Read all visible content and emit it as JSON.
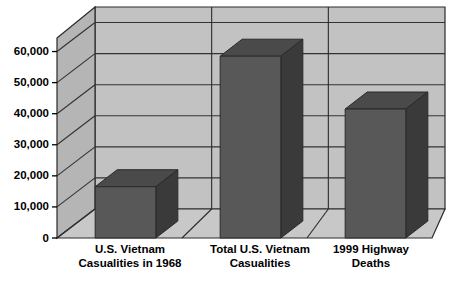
{
  "chart_data": {
    "type": "bar",
    "title": "",
    "subtitle": "",
    "xlabel": "",
    "ylabel": "",
    "categories": [
      "U.S. Vietnam\nCasualities in 1968",
      "Total U.S. Vietnam\nCasualities",
      "1999 Highway\nDeaths"
    ],
    "category_lines": [
      [
        "U.S. Vietnam",
        "Casualities in 1968"
      ],
      [
        "Total U.S. Vietnam",
        "Casualities"
      ],
      [
        "1999 Highway",
        "Deaths"
      ]
    ],
    "values": [
      16500,
      58500,
      41500
    ],
    "ylim": [
      0,
      65000
    ],
    "yticks": [
      0,
      10000,
      20000,
      30000,
      40000,
      50000,
      60000
    ],
    "ytick_labels": [
      "0",
      "10,000",
      "20,000",
      "30,000",
      "40,000",
      "50,000",
      "60,000"
    ],
    "grid": true,
    "legend": false,
    "legend_position": "none",
    "style": "3d-column",
    "colors": {
      "bar_front": "#585858",
      "bar_side": "#3a3a3a",
      "bar_top": "#4a4a4a",
      "wall_back": "#c2c2c2",
      "wall_left": "#b5b5b5",
      "floor": "#c8c8c8",
      "gridline": "#333333",
      "outline": "#2a2a2a",
      "text": "#000000",
      "background": "#ffffff"
    }
  }
}
